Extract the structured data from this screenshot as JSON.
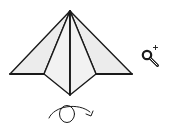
{
  "diagram": {
    "type": "origami-fold-step",
    "colors": {
      "paper": "#ececec",
      "stroke": "#1a1a1a",
      "background": "#ffffff"
    },
    "model": {
      "apex": [
        70,
        11
      ],
      "left_corner": [
        10,
        74
      ],
      "right_corner": [
        132,
        74
      ],
      "inner_left": [
        44,
        74
      ],
      "inner_right": [
        96,
        74
      ],
      "bottom_point": [
        70,
        95
      ]
    },
    "icons": {
      "zoom": "magnifier-plus-icon",
      "turn_over": "turn-over-arrow-icon"
    },
    "instructions": {
      "zoom_label": "",
      "turn_label": ""
    }
  }
}
